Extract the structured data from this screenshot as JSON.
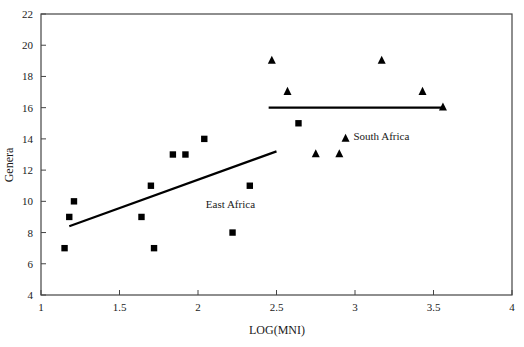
{
  "chart_data": {
    "type": "scatter",
    "title": "",
    "subtitle": "",
    "xlabel": "LOG(MNI)",
    "ylabel": "Genera",
    "xlim": [
      1,
      4
    ],
    "ylim": [
      4,
      22
    ],
    "xticks": [
      "1",
      "1.5",
      "2",
      "2.5",
      "3",
      "3.5",
      "4"
    ],
    "xtick_values": [
      1,
      1.5,
      2,
      2.5,
      3,
      3.5,
      4
    ],
    "yticks": [
      "4",
      "6",
      "8",
      "10",
      "12",
      "14",
      "16",
      "18",
      "20",
      "22"
    ],
    "ytick_values": [
      4,
      6,
      8,
      10,
      12,
      14,
      16,
      18,
      20,
      22
    ],
    "grid": false,
    "legend_position": "inline-annotation",
    "series": [
      {
        "name": "East Africa",
        "marker": "square",
        "color": "#000000",
        "annotation": "East Africa",
        "annotation_x": 2.05,
        "annotation_y": 9.6,
        "points": [
          {
            "x": 1.15,
            "y": 7
          },
          {
            "x": 1.18,
            "y": 9
          },
          {
            "x": 1.21,
            "y": 10
          },
          {
            "x": 1.64,
            "y": 9
          },
          {
            "x": 1.7,
            "y": 11
          },
          {
            "x": 1.72,
            "y": 7
          },
          {
            "x": 1.84,
            "y": 13
          },
          {
            "x": 1.92,
            "y": 13
          },
          {
            "x": 2.04,
            "y": 14
          },
          {
            "x": 2.22,
            "y": 8
          },
          {
            "x": 2.33,
            "y": 11
          },
          {
            "x": 2.64,
            "y": 15
          }
        ],
        "trendline": {
          "x1": 1.18,
          "y1": 8.4,
          "x2": 2.5,
          "y2": 13.2
        }
      },
      {
        "name": "South Africa",
        "marker": "triangle",
        "color": "#000000",
        "annotation": "South Africa",
        "annotation_x": 2.99,
        "annotation_y": 13.9,
        "points": [
          {
            "x": 2.47,
            "y": 19
          },
          {
            "x": 2.57,
            "y": 17
          },
          {
            "x": 2.75,
            "y": 13
          },
          {
            "x": 2.9,
            "y": 13
          },
          {
            "x": 2.94,
            "y": 14
          },
          {
            "x": 3.17,
            "y": 19
          },
          {
            "x": 3.43,
            "y": 17
          },
          {
            "x": 3.56,
            "y": 16
          }
        ],
        "trendline": {
          "x1": 2.45,
          "y1": 16,
          "x2": 3.57,
          "y2": 16
        }
      }
    ]
  },
  "colors": {
    "axis": "#444444",
    "marker": "#000000",
    "trendline": "#000000",
    "text": "#1a1a1a",
    "background": "#ffffff"
  }
}
